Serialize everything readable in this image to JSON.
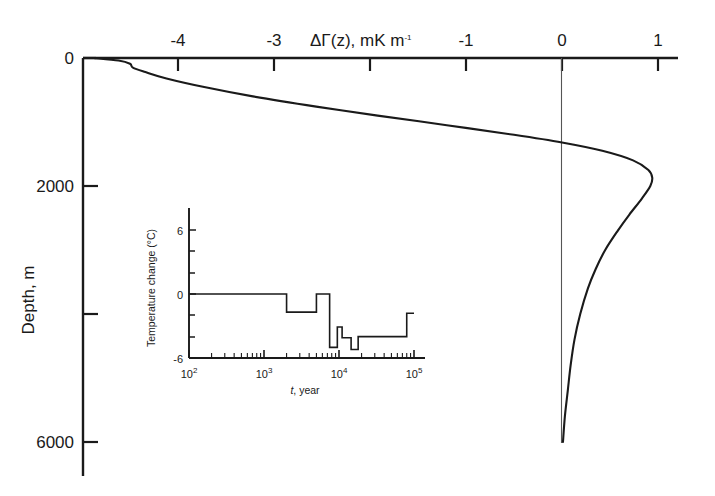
{
  "figure": {
    "title_x_axis": "ΔΓ(z), mK m",
    "title_x_axis_exponent": "-1",
    "y_axis_label": "Depth, m",
    "x_ticks": [
      {
        "value": -4,
        "label": "-4"
      },
      {
        "value": -3,
        "label": "-3"
      },
      {
        "value": -2,
        "label": ""
      },
      {
        "value": -1,
        "label": "-1"
      },
      {
        "value": 0,
        "label": "0"
      },
      {
        "value": 1,
        "label": "1"
      }
    ],
    "y_ticks": [
      {
        "value": 0,
        "label": "0"
      },
      {
        "value": 2000,
        "label": "2000"
      },
      {
        "value": 4000,
        "label": ""
      },
      {
        "value": 6000,
        "label": "6000"
      }
    ],
    "zero_reference_line": "0"
  },
  "inset": {
    "y_axis_label": "Temperature change (°C)",
    "x_axis_label_var": "t",
    "x_axis_label_rest": ", year",
    "y_ticks": [
      {
        "value": 6,
        "label": "6"
      },
      {
        "value": 4,
        "label": ""
      },
      {
        "value": 2,
        "label": ""
      },
      {
        "value": 0,
        "label": "0"
      },
      {
        "value": -2,
        "label": ""
      },
      {
        "value": -4,
        "label": ""
      },
      {
        "value": -6,
        "label": "-6"
      }
    ],
    "x_ticks": [
      {
        "value": 2,
        "mantissa": "10",
        "exponent": "2"
      },
      {
        "value": 3,
        "mantissa": "10",
        "exponent": "3"
      },
      {
        "value": 4,
        "mantissa": "10",
        "exponent": "4"
      },
      {
        "value": 5,
        "mantissa": "10",
        "exponent": "5"
      }
    ]
  },
  "colors": {
    "axis": "#1a1a1a",
    "curve": "#1a1a1a",
    "zero_line": "#555555",
    "background": "#ffffff"
  },
  "chart_data": {
    "type": "line",
    "title": "ΔΓ(z), mK m-1",
    "xlabel": "ΔΓ(z), mK m-1",
    "ylabel": "Depth, m",
    "xlim": [
      -5.0,
      1.2
    ],
    "ylim": [
      0,
      6600
    ],
    "y_axis_inverted": true,
    "grid": false,
    "legend": "none",
    "annotations": [
      "vertical reference line at ΔΓ(z) = 0"
    ],
    "series": [
      {
        "name": "ΔΓ(z) geothermal gradient perturbation",
        "x_label": "ΔΓ(z), mK m-1",
        "y_label": "Depth, m",
        "points": [
          {
            "depth": 0,
            "value": -4.88
          },
          {
            "depth": 40,
            "value": -4.62
          },
          {
            "depth": 90,
            "value": -4.5
          },
          {
            "depth": 150,
            "value": -4.47
          },
          {
            "depth": 220,
            "value": -4.34
          },
          {
            "depth": 320,
            "value": -4.12
          },
          {
            "depth": 450,
            "value": -3.74
          },
          {
            "depth": 600,
            "value": -3.22
          },
          {
            "depth": 760,
            "value": -2.56
          },
          {
            "depth": 900,
            "value": -1.92
          },
          {
            "depth": 1050,
            "value": -1.2
          },
          {
            "depth": 1200,
            "value": -0.5
          },
          {
            "depth": 1320,
            "value": 0.0
          },
          {
            "depth": 1450,
            "value": 0.42
          },
          {
            "depth": 1600,
            "value": 0.74
          },
          {
            "depth": 1750,
            "value": 0.9
          },
          {
            "depth": 1870,
            "value": 0.94
          },
          {
            "depth": 2000,
            "value": 0.92
          },
          {
            "depth": 2200,
            "value": 0.83
          },
          {
            "depth": 2450,
            "value": 0.7
          },
          {
            "depth": 2700,
            "value": 0.58
          },
          {
            "depth": 3000,
            "value": 0.45
          },
          {
            "depth": 3300,
            "value": 0.35
          },
          {
            "depth": 3600,
            "value": 0.27
          },
          {
            "depth": 4000,
            "value": 0.19
          },
          {
            "depth": 4400,
            "value": 0.13
          },
          {
            "depth": 4800,
            "value": 0.09
          },
          {
            "depth": 5200,
            "value": 0.06
          },
          {
            "depth": 5600,
            "value": 0.03
          },
          {
            "depth": 6000,
            "value": 0.01
          }
        ]
      }
    ]
  },
  "inset_chart_data": {
    "type": "line",
    "title": "",
    "xlabel": "t, year",
    "ylabel": "Temperature change (°C)",
    "xscale": "log",
    "xlim": [
      100,
      100000
    ],
    "ylim": [
      -6,
      7
    ],
    "grid": false,
    "legend": "none",
    "step_style": "post",
    "series": [
      {
        "name": "Surface temperature change history",
        "points": [
          {
            "t": 100,
            "dT": 0.0
          },
          {
            "t": 2000,
            "dT": 0.0
          },
          {
            "t": 2000,
            "dT": -1.7
          },
          {
            "t": 5000,
            "dT": -1.7
          },
          {
            "t": 5000,
            "dT": 0.0
          },
          {
            "t": 7500,
            "dT": 0.0
          },
          {
            "t": 7500,
            "dT": -5.0
          },
          {
            "t": 9500,
            "dT": -5.0
          },
          {
            "t": 9500,
            "dT": -3.1
          },
          {
            "t": 11000,
            "dT": -3.1
          },
          {
            "t": 11000,
            "dT": -4.1
          },
          {
            "t": 14500,
            "dT": -4.1
          },
          {
            "t": 14500,
            "dT": -5.2
          },
          {
            "t": 18000,
            "dT": -5.2
          },
          {
            "t": 18000,
            "dT": -4.0
          },
          {
            "t": 80000,
            "dT": -4.0
          },
          {
            "t": 80000,
            "dT": -1.8
          },
          {
            "t": 100000,
            "dT": -1.8
          }
        ]
      }
    ]
  }
}
